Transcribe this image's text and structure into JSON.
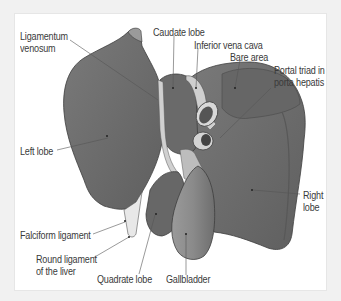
{
  "diagram": {
    "colors": {
      "liver": "#6f6f6f",
      "liver_dark": "#565656",
      "liver_outline": "#3e3e3e",
      "gallbladder": "#8a8a8a",
      "vessel_light": "#cfcfcf",
      "frame_bg": "#f1f1f1",
      "panel_bg": "#ffffff",
      "label_text": "#3a3a3a",
      "leader_line": "#555555"
    },
    "labels": {
      "ligamentum_venosum": [
        "Ligamentum",
        "venosum"
      ],
      "caudate_lobe": "Caudate lobe",
      "inferior_vena_cava": "Inferior vena cava",
      "bare_area": "Bare area",
      "portal_triad": [
        "Portal triad in",
        "porta hepatis"
      ],
      "left_lobe": "Left lobe",
      "right_lobe": [
        "Right",
        "lobe"
      ],
      "falciform_ligament": "Falciform ligament",
      "round_ligament": [
        "Round ligament",
        "of the liver"
      ],
      "quadrate_lobe": "Quadrate lobe",
      "gallbladder": "Gallbladder"
    }
  }
}
